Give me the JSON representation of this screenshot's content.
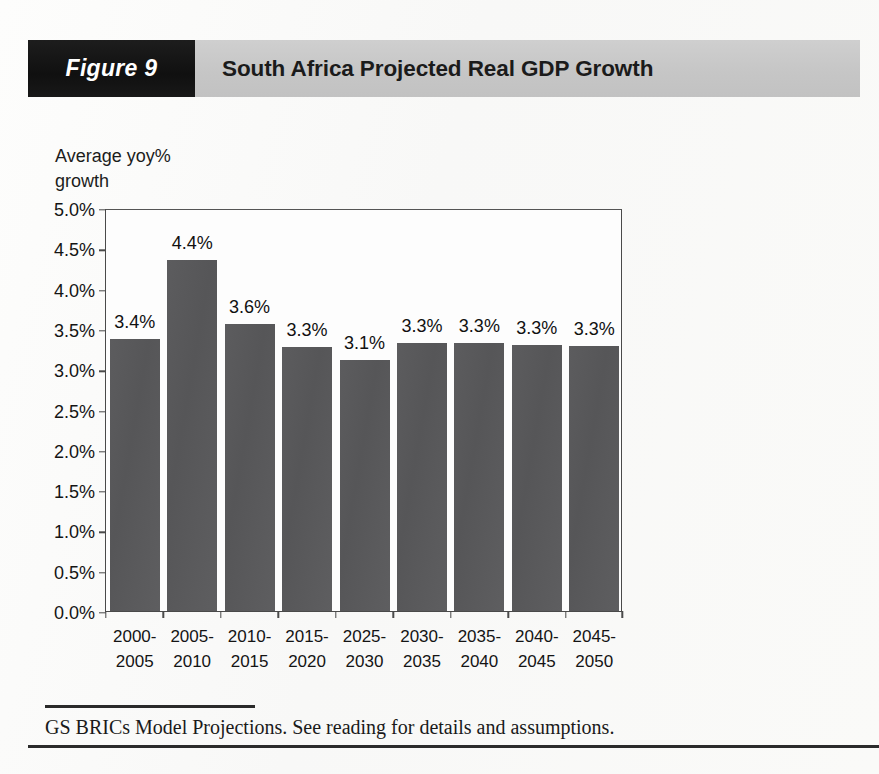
{
  "header": {
    "figure_tag": "Figure 9",
    "title": "South Africa Projected Real GDP Growth"
  },
  "footnote": {
    "text": "GS BRICs Model Projections. See reading for details and assumptions."
  },
  "colors": {
    "bar_fill": "#59595b",
    "header_band": "#c9c9c9",
    "figure_tag_bg": "#151515",
    "axis_line": "#4a4a4a",
    "page_bg": "#fbfbfa"
  },
  "chart_data": {
    "type": "bar",
    "title": "South Africa Projected Real GDP Growth",
    "xlabel": "",
    "ylabel": "Average yoy%\ngrowth",
    "ylim": [
      0,
      5
    ],
    "yticks": [
      0,
      0.5,
      1,
      1.5,
      2,
      2.5,
      3,
      3.5,
      4,
      4.5,
      5
    ],
    "ytick_labels": [
      "0.0%",
      "0.5%",
      "1.0%",
      "1.5%",
      "2.0%",
      "2.5%",
      "3.0%",
      "3.5%",
      "4.0%",
      "4.5%",
      "5.0%"
    ],
    "grid": false,
    "legend": false,
    "categories": [
      "2000-\n2005",
      "2005-\n2010",
      "2010-\n2015",
      "2015-\n2020",
      "2025-\n2030",
      "2030-\n2035",
      "2035-\n2040",
      "2040-\n2045",
      "2045-\n2050"
    ],
    "values": [
      3.4,
      4.4,
      3.6,
      3.3,
      3.1,
      3.3,
      3.3,
      3.3,
      3.3
    ],
    "bar_heights_drawn": [
      3.38,
      4.35,
      3.56,
      3.27,
      3.11,
      3.33,
      3.33,
      3.3,
      3.29
    ],
    "data_labels": [
      "3.4%",
      "4.4%",
      "3.6%",
      "3.3%",
      "3.1%",
      "3.3%",
      "3.3%",
      "3.3%",
      "3.3%"
    ]
  }
}
